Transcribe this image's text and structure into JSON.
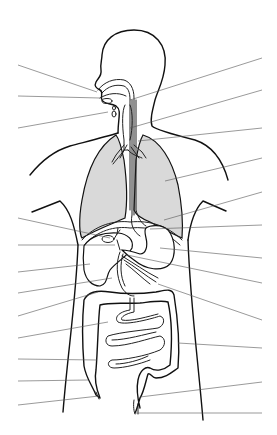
{
  "diagram": {
    "colors": {
      "background": "#ffffff",
      "outline": "#111111",
      "lung_fill": "#d9d9d9",
      "leader_line": "#555555"
    },
    "leader_lines_left": [
      {
        "x1": 18,
        "y1": 65,
        "x2": 97,
        "y2": 92
      },
      {
        "x1": 18,
        "y1": 96,
        "x2": 100,
        "y2": 98
      },
      {
        "x1": 18,
        "y1": 128,
        "x2": 108,
        "y2": 112
      },
      {
        "x1": 18,
        "y1": 218,
        "x2": 110,
        "y2": 238
      },
      {
        "x1": 18,
        "y1": 245,
        "x2": 115,
        "y2": 245
      },
      {
        "x1": 18,
        "y1": 272,
        "x2": 90,
        "y2": 264
      },
      {
        "x1": 18,
        "y1": 293,
        "x2": 112,
        "y2": 278
      },
      {
        "x1": 18,
        "y1": 316,
        "x2": 98,
        "y2": 292
      },
      {
        "x1": 18,
        "y1": 338,
        "x2": 108,
        "y2": 322
      },
      {
        "x1": 18,
        "y1": 359,
        "x2": 97,
        "y2": 360
      },
      {
        "x1": 18,
        "y1": 381,
        "x2": 88,
        "y2": 380
      },
      {
        "x1": 18,
        "y1": 405,
        "x2": 99,
        "y2": 396
      }
    ],
    "leader_lines_right": [
      {
        "x1": 262,
        "y1": 58,
        "x2": 130,
        "y2": 100
      },
      {
        "x1": 262,
        "y1": 90,
        "x2": 130,
        "y2": 128
      },
      {
        "x1": 262,
        "y1": 128,
        "x2": 138,
        "y2": 141
      },
      {
        "x1": 262,
        "y1": 158,
        "x2": 165,
        "y2": 181
      },
      {
        "x1": 262,
        "y1": 192,
        "x2": 164,
        "y2": 220
      },
      {
        "x1": 262,
        "y1": 225,
        "x2": 150,
        "y2": 229
      },
      {
        "x1": 262,
        "y1": 258,
        "x2": 160,
        "y2": 248
      },
      {
        "x1": 262,
        "y1": 283,
        "x2": 127,
        "y2": 255
      },
      {
        "x1": 262,
        "y1": 320,
        "x2": 158,
        "y2": 284
      },
      {
        "x1": 262,
        "y1": 348,
        "x2": 178,
        "y2": 343
      },
      {
        "x1": 262,
        "y1": 382,
        "x2": 140,
        "y2": 397
      },
      {
        "x1": 262,
        "y1": 413,
        "x2": 135,
        "y2": 413
      }
    ]
  }
}
